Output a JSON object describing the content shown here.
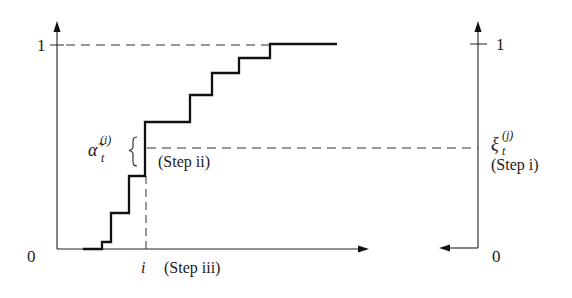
{
  "diagram": {
    "type": "inverse-transform-sampling-staircase",
    "left_plot": {
      "y_tick_top": "1",
      "origin_label": "0",
      "x_marker_label": "i",
      "x_step_label": "(Step iii)",
      "alpha_symbol": "α̃",
      "alpha_subscript": "t",
      "alpha_superscript": "(i)",
      "brace": "{",
      "step_ii_label": "(Step ii)"
    },
    "right_plot": {
      "y_tick_top": "1",
      "origin_label": "0",
      "xi_symbol": "ξ",
      "xi_subscript": "t",
      "xi_superscript": "(j)",
      "step_i_label": "(Step i)"
    },
    "staircase_points": [
      [
        83,
        249
      ],
      [
        102,
        249
      ],
      [
        102,
        242
      ],
      [
        111,
        242
      ],
      [
        111,
        213
      ],
      [
        129,
        213
      ],
      [
        129,
        176
      ],
      [
        145,
        176
      ],
      [
        145,
        122
      ],
      [
        190,
        122
      ],
      [
        190,
        95
      ],
      [
        212,
        95
      ],
      [
        212,
        73
      ],
      [
        239,
        73
      ],
      [
        239,
        58
      ],
      [
        270,
        58
      ],
      [
        270,
        44
      ],
      [
        337,
        44
      ]
    ],
    "colors": {
      "line": "#111111",
      "axis": "#222222",
      "dashed": "#333333",
      "text": "#1a1a1a"
    }
  }
}
